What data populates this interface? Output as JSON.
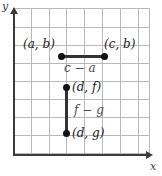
{
  "figure": {
    "type": "coordinate-grid-diagram",
    "background_color": "#ffffff",
    "grid_color": "#b9b9bd",
    "axis_color": "#3b3b3b",
    "segment_color": "#333333",
    "point_color": "#111111"
  },
  "axes": {
    "x_label": "x",
    "y_label": "y",
    "x_arrow": "arrow-right",
    "y_arrow": "arrow-up"
  },
  "grid": {
    "columns": 8,
    "rows": 8,
    "cell_size_px": 18
  },
  "points": [
    {
      "label": "(a, b)",
      "name": "point-a-b"
    },
    {
      "label": "(c, b)",
      "name": "point-c-b"
    },
    {
      "label": "(d, f)",
      "name": "point-d-f"
    },
    {
      "label": "(d, g)",
      "name": "point-d-g"
    }
  ],
  "segments": [
    {
      "name": "horizontal-segment",
      "orientation": "horizontal",
      "from": "(a, b)",
      "to": "(c, b)",
      "length_label": "c − a"
    },
    {
      "name": "vertical-segment",
      "orientation": "vertical",
      "from": "(d, f)",
      "to": "(d, g)",
      "length_label": "f − g"
    }
  ]
}
